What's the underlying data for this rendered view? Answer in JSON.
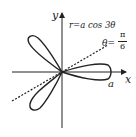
{
  "diagram": {
    "type": "polar-curve",
    "curve_label": "r=a cos 3θ",
    "line_label_lhs": "θ=",
    "line_label_num": "π",
    "line_label_den": "6",
    "axis_x_label": "x",
    "axis_y_label": "y",
    "petal_tip_label": "a",
    "colors": {
      "stroke": "#222222",
      "background": "#ffffff"
    }
  }
}
